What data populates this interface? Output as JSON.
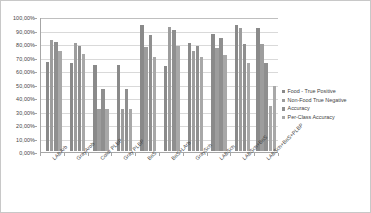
{
  "chart_data": {
    "type": "bar",
    "title": "",
    "xlabel": "",
    "ylabel": "",
    "ylim": [
      0,
      100
    ],
    "grid": true,
    "legend_position": "right",
    "y_tick_labels": [
      "100,00%",
      "90,00%",
      "80,00%",
      "70,00%",
      "60,00%",
      "50,00%",
      "40,00%",
      "30,00%",
      "20,00%",
      "10,00%",
      "0,00%"
    ],
    "y_tick_values": [
      100,
      90,
      80,
      70,
      60,
      50,
      40,
      30,
      20,
      10,
      0
    ],
    "categories": [
      "LABArb",
      "GrayArob",
      "Color PLBP",
      "Gray PLBP",
      "BoS",
      "BoS+LArb",
      "GraySch",
      "LABSch",
      "LABSch+BoS",
      "LABSch+BoS+PLBP"
    ],
    "series": [
      {
        "name": "Food - True Positive",
        "color": "#8a8a8a",
        "values": [
          66,
          65,
          64,
          64,
          93,
          63,
          80,
          87,
          93,
          91
        ]
      },
      {
        "name": "Non-Food True Negative",
        "color": "#9d9d9d",
        "values": [
          82,
          80,
          31,
          31,
          77,
          92,
          74,
          76,
          91,
          79
        ]
      },
      {
        "name": "Accuracy",
        "color": "#8f8f8f",
        "values": [
          81,
          78,
          46,
          46,
          86,
          90,
          78,
          84,
          79,
          65
        ]
      },
      {
        "name": "Per-Class Accuracy",
        "color": "#a8a8a8",
        "values": [
          74,
          72,
          31,
          31,
          70,
          78,
          70,
          71,
          65,
          33
        ]
      },
      {
        "name": "Per-Class Accuracy",
        "color": "#a8a8a8",
        "values": [
          null,
          null,
          null,
          null,
          null,
          null,
          null,
          null,
          null,
          48
        ]
      }
    ],
    "legend": [
      "Food - True Positive",
      "Non-Food True Negative",
      "Accuracy",
      "Per-Class Accuracy"
    ]
  }
}
